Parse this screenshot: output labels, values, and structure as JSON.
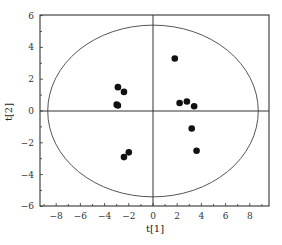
{
  "chart_data": {
    "type": "scatter",
    "title": "",
    "xlabel": "t[1]",
    "ylabel": "t[2]",
    "xlim": [
      -9.5,
      9.5
    ],
    "ylim": [
      -6,
      6
    ],
    "xticks": [
      -8,
      -6,
      -4,
      -2,
      0,
      2,
      4,
      6,
      8
    ],
    "yticks": [
      -6,
      -4,
      -2,
      0,
      2,
      4,
      6
    ],
    "xtick_labels": [
      "−8",
      "−6",
      "−4",
      "−2",
      "0",
      "2",
      "4",
      "6",
      "8"
    ],
    "ytick_labels": [
      "−6",
      "−4",
      "−2",
      "0",
      "2",
      "4",
      "6"
    ],
    "grid": false,
    "legend": null,
    "reference_lines": {
      "x": 0,
      "y": 0
    },
    "ellipse": {
      "center": [
        0,
        0
      ],
      "rx": 8.7,
      "ry": 5.4,
      "label": "Hotelling T2 confidence ellipse"
    },
    "series": [
      {
        "name": "samples",
        "color": "#111111",
        "points": [
          {
            "x": -2.9,
            "y": 1.5
          },
          {
            "x": -2.4,
            "y": 1.2
          },
          {
            "x": -3.0,
            "y": 0.4
          },
          {
            "x": -2.9,
            "y": 0.35
          },
          {
            "x": -2.0,
            "y": -2.6
          },
          {
            "x": -2.4,
            "y": -2.9
          },
          {
            "x": 1.8,
            "y": 3.3
          },
          {
            "x": 2.2,
            "y": 0.5
          },
          {
            "x": 2.8,
            "y": 0.6
          },
          {
            "x": 3.4,
            "y": 0.3
          },
          {
            "x": 3.2,
            "y": -1.1
          },
          {
            "x": 3.6,
            "y": -2.5
          }
        ]
      }
    ]
  },
  "colors": {
    "axis": "#333333",
    "ellipse": "#555555",
    "points": "#111111"
  }
}
